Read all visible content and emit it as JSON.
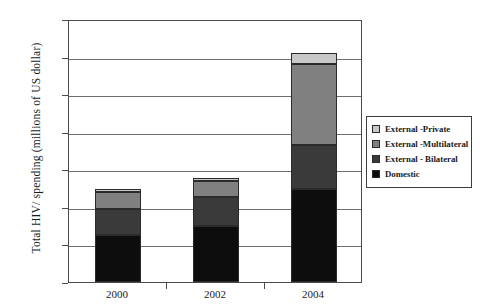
{
  "chart_data": {
    "type": "bar",
    "subtype": "stacked-bar",
    "title": "",
    "xlabel": "",
    "ylabel": "Total HIV/ spending (millions of US dollar)",
    "categories": [
      "2000",
      "2002",
      "2004"
    ],
    "ylim": [
      0,
      7000
    ],
    "ytick_labels": [
      "0",
      "1000",
      "2000",
      "3000",
      "4000",
      "5000",
      "6000",
      "7000"
    ],
    "ytick_values": [
      0,
      1000,
      2000,
      3000,
      4000,
      5000,
      6000,
      7000
    ],
    "grid": true,
    "grid_axis": "y",
    "legend_position": "right",
    "stack_order_bottom_to_top": [
      "Domestic",
      "External - Bilateral",
      "External -Multilateral",
      "External -Private"
    ],
    "series": [
      {
        "name": "Domestic",
        "color": "#0d0d0d",
        "values": [
          1250,
          1480,
          2480
        ]
      },
      {
        "name": "External - Bilateral",
        "color": "#3a3a3a",
        "values": [
          700,
          780,
          1170
        ]
      },
      {
        "name": "External -Multilateral",
        "color": "#808080",
        "values": [
          450,
          420,
          2150
        ]
      },
      {
        "name": "External -Private",
        "color": "#c8c8c8",
        "values": [
          80,
          100,
          300
        ]
      }
    ],
    "totals": [
      2480,
      2780,
      6100
    ],
    "legend_entries": [
      {
        "label": "External -Private",
        "color": "#c8c8c8"
      },
      {
        "label": "External -Multilateral",
        "color": "#808080"
      },
      {
        "label": "External - Bilateral",
        "color": "#3a3a3a"
      },
      {
        "label": "Domestic",
        "color": "#0d0d0d"
      }
    ]
  },
  "axis_colors": {
    "frame": "#4a4a4a",
    "gridline": "#6e6e6e",
    "bar_outline": "#2b2b2b"
  }
}
